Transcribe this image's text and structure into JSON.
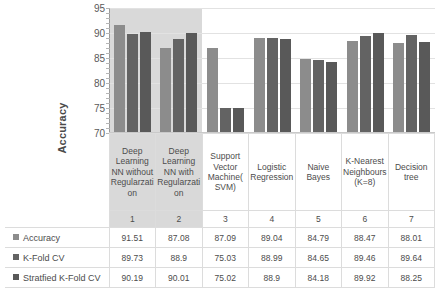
{
  "chart_data": {
    "type": "bar",
    "title": "",
    "xlabel": "",
    "ylabel": "Accuracy",
    "ylim": [
      70,
      95
    ],
    "yticks": [
      70,
      75,
      80,
      85,
      90,
      95
    ],
    "grid": true,
    "legend_position": "table-left",
    "indices": [
      "1",
      "2",
      "3",
      "4",
      "5",
      "6",
      "7"
    ],
    "categories": [
      "Deep Learning NN without Regularzation",
      "Deep Learning NN with Regularzation",
      "Support Vector Machine( SVM)",
      "Logistic Regression",
      "Naive Bayes",
      "K-Nearest Neighbours (K=8)",
      "Decision tree"
    ],
    "series": [
      {
        "name": "Accuracy",
        "color": "#8c8c8c",
        "values": [
          91.51,
          87.08,
          87.09,
          89.04,
          84.79,
          88.47,
          88.01
        ]
      },
      {
        "name": "K-Fold CV",
        "color": "#636363",
        "values": [
          89.73,
          88.9,
          75.03,
          88.99,
          84.65,
          89.46,
          89.64
        ]
      },
      {
        "name": "Stratfied K-Fold CV",
        "color": "#595959",
        "values": [
          90.19,
          90.01,
          75.02,
          88.9,
          84.18,
          89.92,
          88.25
        ]
      }
    ],
    "highlighted_categories": [
      "1",
      "2"
    ]
  },
  "display": {
    "series_values_text": [
      [
        "91.51",
        "87.08",
        "87.09",
        "89.04",
        "84.79",
        "88.47",
        "88.01"
      ],
      [
        "89.73",
        "88.9",
        "75.03",
        "88.99",
        "84.65",
        "89.46",
        "89.64"
      ],
      [
        "90.19",
        "90.01",
        "75.02",
        "88.9",
        "84.18",
        "89.92",
        "88.25"
      ]
    ]
  }
}
